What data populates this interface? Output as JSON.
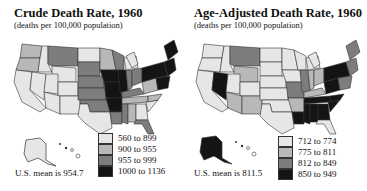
{
  "left": {
    "title": "Crude Death Rate, 1960",
    "subtitle": "(deaths per 100,000 population)",
    "mean": "U.S. mean is 954.7",
    "legend": [
      {
        "label": "560 to 899",
        "color": "#e6e6e6"
      },
      {
        "label": "900 to 955",
        "color": "#b8b8b8"
      },
      {
        "label": "955 to 999",
        "color": "#7d7d7d"
      },
      {
        "label": "1000 to 1136",
        "color": "#141414"
      }
    ]
  },
  "right": {
    "title": "Age-Adjusted Death Rate, 1960",
    "subtitle": "(deaths per 100,000 population)",
    "mean": "U.S. mean is 811.5",
    "legend": [
      {
        "label": "712 to 774",
        "color": "#e6e6e6"
      },
      {
        "label": "775 to 811",
        "color": "#b8b8b8"
      },
      {
        "label": "812 to 849",
        "color": "#7d7d7d"
      },
      {
        "label": "850 to 949",
        "color": "#141414"
      }
    ]
  }
}
